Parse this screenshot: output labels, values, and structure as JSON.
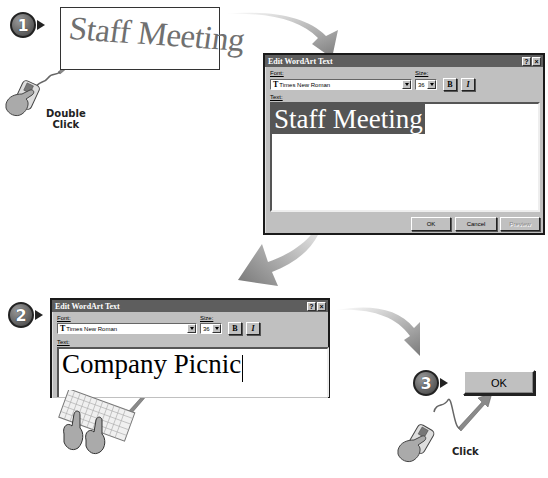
{
  "steps": [
    {
      "number": "1",
      "action_label_line1": "Double",
      "action_label_line2": "Click"
    },
    {
      "number": "2"
    },
    {
      "number": "3",
      "action_label": "Click"
    }
  ],
  "wordart_preview": {
    "text": "Staff Meeting"
  },
  "dialog_1": {
    "title": "Edit WordArt Text",
    "help_button": "?",
    "close_button": "×",
    "font_label": "Font:",
    "font_value": "Times New Roman",
    "font_icon_glyph": "T",
    "size_label": "Size:",
    "size_value": "36",
    "bold_label": "B",
    "italic_label": "I",
    "text_label": "Text:",
    "text_value": "Staff Meeting",
    "ok_label": "OK",
    "cancel_label": "Cancel",
    "preview_label": "Preview"
  },
  "dialog_2": {
    "title": "Edit WordArt Text",
    "help_button": "?",
    "close_button": "×",
    "font_label": "Font:",
    "font_value": "Times New Roman",
    "font_icon_glyph": "T",
    "size_label": "Size:",
    "size_value": "36",
    "bold_label": "B",
    "italic_label": "I",
    "text_label": "Text:",
    "text_value": "Company Picnic"
  },
  "ok_button_large": {
    "label": "OK"
  },
  "colors": {
    "dialog_bg": "#c0c0c0",
    "titlebar": "#5e5e5e",
    "selection": "#555555",
    "arrow_gray": "#8a8a8a"
  }
}
